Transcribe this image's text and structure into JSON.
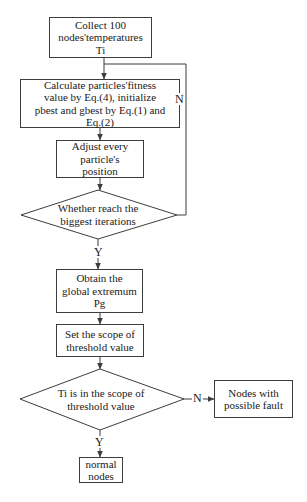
{
  "flowchart": {
    "nodes": {
      "collect": {
        "label": "Collect 100\nnodes'temperatures\nTi"
      },
      "calculate": {
        "label": "Calculate particles'fitness\nvalue by Eq.(4), initialize\npbest and gbest by Eq.(1) and\nEq.(2)"
      },
      "adjust": {
        "label": "Adjust every\nparticle's\nposition"
      },
      "iteration_decision": {
        "label": "Whether reach the\nbiggest iterations"
      },
      "obtain": {
        "label": "Obtain the\nglobal extremum\nPg"
      },
      "set_scope": {
        "label": "Set the scope of\nthreshold value"
      },
      "scope_decision": {
        "label": "Ti is in the scope of\nthreshold value"
      },
      "fault": {
        "label": "Nodes with\npossible fault"
      },
      "normal": {
        "label": "normal\nnodes"
      }
    },
    "edge_labels": {
      "iteration_no": "N",
      "iteration_yes": "Y",
      "scope_no": "N",
      "scope_yes": "Y"
    },
    "colors": {
      "stroke": "#3d3d3d",
      "background": "#ffffff",
      "text": "#1a1a1a"
    }
  }
}
